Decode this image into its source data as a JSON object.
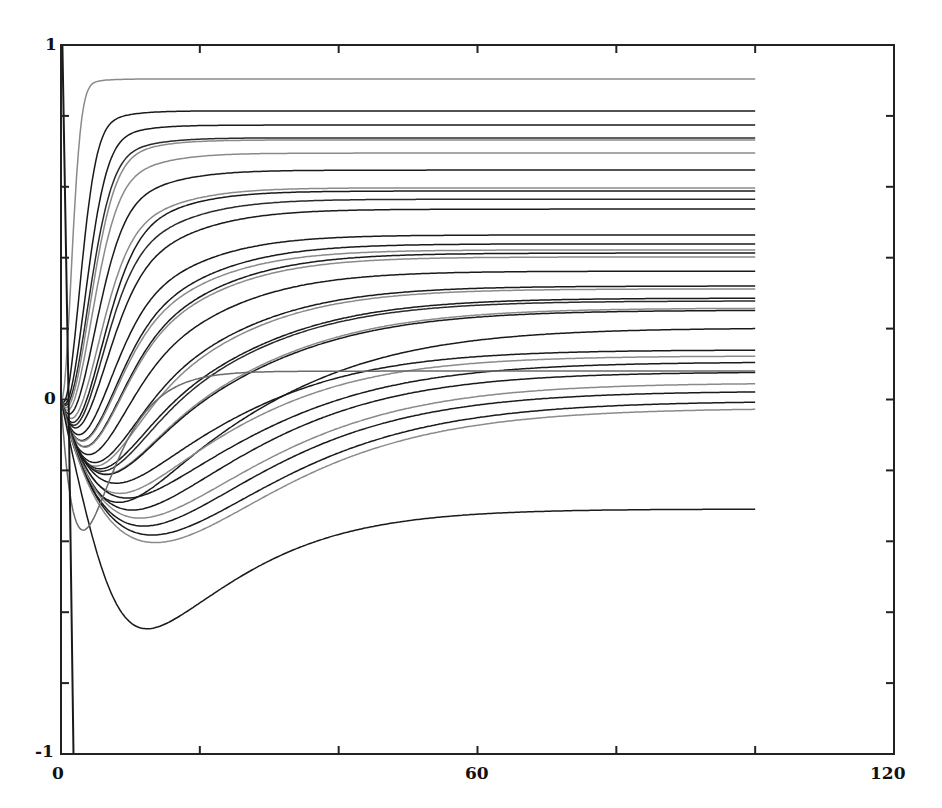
{
  "chart_data": {
    "type": "line",
    "title": "",
    "xlabel": "",
    "ylabel": "",
    "xlim": [
      0,
      120
    ],
    "ylim": [
      -1,
      1
    ],
    "grid": false,
    "legend": null,
    "x_tick_labels": [
      "0",
      "60",
      "120"
    ],
    "y_tick_labels": [
      "1",
      "0",
      "-1"
    ],
    "x_minor_ticks": [
      20,
      40,
      60,
      80,
      100
    ],
    "y_minor_ticks": [
      0.8,
      0.6,
      0.4,
      0.2,
      0,
      -0.2,
      -0.4,
      -0.6,
      -0.8
    ],
    "t_end": 100,
    "series": [
      {
        "name": "s1",
        "color": "#8a8a8a",
        "final": 0.904,
        "dip": -0.02,
        "t_dip": 1.5,
        "t_rise": 4
      },
      {
        "name": "s2",
        "color": "#1a1a1a",
        "final": 0.814,
        "dip": -0.05,
        "t_dip": 2.5,
        "t_rise": 7
      },
      {
        "name": "s3",
        "color": "#1a1a1a",
        "final": 0.774,
        "dip": -0.06,
        "t_dip": 3,
        "t_rise": 9
      },
      {
        "name": "s4",
        "color": "#2a2a2a",
        "final": 0.738,
        "dip": -0.07,
        "t_dip": 3.5,
        "t_rise": 10
      },
      {
        "name": "s5",
        "color": "#8a8a8a",
        "final": 0.732,
        "dip": -0.08,
        "t_dip": 3.5,
        "t_rise": 10.5
      },
      {
        "name": "s6",
        "color": "#8a8a8a",
        "final": 0.695,
        "dip": -0.1,
        "t_dip": 4,
        "t_rise": 11
      },
      {
        "name": "s7",
        "color": "#1a1a1a",
        "final": 0.647,
        "dip": -0.12,
        "t_dip": 4.5,
        "t_rise": 12
      },
      {
        "name": "s8",
        "color": "#8a8a8a",
        "final": 0.597,
        "dip": -0.14,
        "t_dip": 5,
        "t_rise": 13
      },
      {
        "name": "s9",
        "color": "#1a1a1a",
        "final": 0.588,
        "dip": -0.15,
        "t_dip": 5,
        "t_rise": 14
      },
      {
        "name": "s10",
        "color": "#2a2a2a",
        "final": 0.565,
        "dip": -0.17,
        "t_dip": 5.5,
        "t_rise": 14
      },
      {
        "name": "s11",
        "color": "#1a1a1a",
        "final": 0.537,
        "dip": -0.18,
        "t_dip": 6,
        "t_rise": 15
      },
      {
        "name": "s12",
        "color": "#1a1a1a",
        "final": 0.464,
        "dip": -0.2,
        "t_dip": 6.5,
        "t_rise": 16
      },
      {
        "name": "s13",
        "color": "#1a1a1a",
        "final": 0.439,
        "dip": -0.22,
        "t_dip": 7,
        "t_rise": 17
      },
      {
        "name": "s14",
        "color": "#8a8a8a",
        "final": 0.422,
        "dip": -0.22,
        "t_dip": 7,
        "t_rise": 17
      },
      {
        "name": "s15",
        "color": "#1a1a1a",
        "final": 0.413,
        "dip": -0.24,
        "t_dip": 7.5,
        "t_rise": 18
      },
      {
        "name": "s16",
        "color": "#8a8a8a",
        "final": 0.402,
        "dip": -0.24,
        "t_dip": 7.5,
        "t_rise": 18
      },
      {
        "name": "s17",
        "color": "#1a1a1a",
        "final": 0.362,
        "dip": -0.26,
        "t_dip": 8,
        "t_rise": 19
      },
      {
        "name": "s18",
        "color": "#1a1a1a",
        "final": 0.32,
        "dip": -0.28,
        "t_dip": 9,
        "t_rise": 21
      },
      {
        "name": "s19",
        "color": "#8a8a8a",
        "final": 0.312,
        "dip": -0.29,
        "t_dip": 9,
        "t_rise": 21
      },
      {
        "name": "s20",
        "color": "#1a1a1a",
        "final": 0.286,
        "dip": -0.3,
        "t_dip": 10,
        "t_rise": 22
      },
      {
        "name": "s21",
        "color": "#2a2a2a",
        "final": 0.278,
        "dip": -0.3,
        "t_dip": 10,
        "t_rise": 23
      },
      {
        "name": "s22",
        "color": "#8a8a8a",
        "final": 0.258,
        "dip": -0.31,
        "t_dip": 11,
        "t_rise": 24
      },
      {
        "name": "s23",
        "color": "#1a1a1a",
        "final": 0.252,
        "dip": -0.31,
        "t_dip": 11,
        "t_rise": 24
      },
      {
        "name": "s24",
        "color": "#1a1a1a",
        "final": 0.202,
        "dip": -0.38,
        "t_dip": 12,
        "t_rise": 26
      },
      {
        "name": "s25",
        "color": "#1a1a1a",
        "final": 0.14,
        "dip": -0.3,
        "t_dip": 11,
        "t_rise": 24
      },
      {
        "name": "s26",
        "color": "#8a8a8a",
        "final": 0.123,
        "dip": -0.32,
        "t_dip": 11,
        "t_rise": 25
      },
      {
        "name": "s27",
        "color": "#1a1a1a",
        "final": 0.106,
        "dip": -0.33,
        "t_dip": 12,
        "t_rise": 26
      },
      {
        "name": "s28",
        "color": "#1a1a1a",
        "final": 0.078,
        "dip": -0.35,
        "t_dip": 12,
        "t_rise": 27
      },
      {
        "name": "s29",
        "color": "#8a8a8a",
        "final": 0.047,
        "dip": -0.36,
        "t_dip": 12.5,
        "t_rise": 27
      },
      {
        "name": "s30",
        "color": "#1a1a1a",
        "final": 0.024,
        "dip": -0.37,
        "t_dip": 12.5,
        "t_rise": 28
      },
      {
        "name": "s31",
        "color": "#1a1a1a",
        "final": -0.004,
        "dip": -0.38,
        "t_dip": 13,
        "t_rise": 28
      },
      {
        "name": "s32",
        "color": "#8a8a8a",
        "final": -0.024,
        "dip": -0.39,
        "t_dip": 13,
        "t_rise": 29
      },
      {
        "name": "s33",
        "color": "#1a1a1a",
        "final": -0.309,
        "dip": -0.36,
        "t_dip": 10,
        "t_rise": 14
      },
      {
        "name": "s34",
        "color": "#6a6a6a",
        "final": 0.08,
        "dip": -0.39,
        "t_dip": 3.5,
        "t_rise": 12
      }
    ],
    "spike_series": {
      "name": "transient",
      "color": "#1a1a1a",
      "points": [
        [
          0.2,
          1.0
        ],
        [
          1.1,
          0.0
        ],
        [
          1.8,
          -1.0
        ]
      ]
    }
  }
}
